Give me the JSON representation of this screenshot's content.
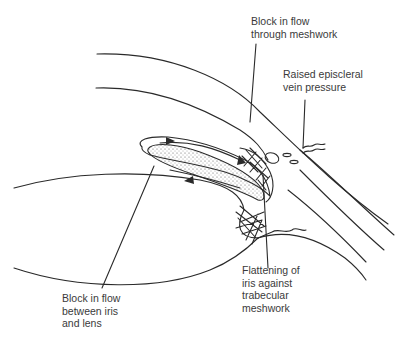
{
  "diagram": {
    "type": "anatomical-cross-section",
    "colors": {
      "line": "#2a2a2a",
      "text": "#3a3a3a",
      "background": "#ffffff",
      "stipple": "#555555"
    },
    "labels": {
      "meshwork_block": {
        "lines": [
          "Block in flow",
          "through meshwork"
        ]
      },
      "episcleral": {
        "lines": [
          "Raised episcleral",
          "vein pressure"
        ]
      },
      "iris_lens_block": {
        "lines": [
          "Block in flow",
          "between iris",
          "and lens"
        ]
      },
      "iris_flattening": {
        "lines": [
          "Flattening of",
          "iris against",
          "trabecular",
          "meshwork"
        ]
      }
    },
    "flow_arrows": [
      {
        "name": "forward-flow-arrow-top",
        "direction": "right"
      },
      {
        "name": "flow-into-meshwork-arrow",
        "direction": "down-right"
      },
      {
        "name": "return-flow-arrow",
        "direction": "left"
      }
    ]
  }
}
